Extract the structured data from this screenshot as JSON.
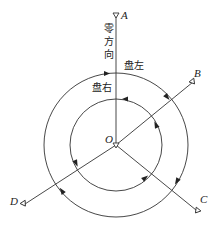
{
  "diagram": {
    "title": "",
    "center_label": "O",
    "zero_direction_label": "零方向",
    "zero_direction_chars": [
      "零",
      "方",
      "向"
    ],
    "outer_circle_label": "盘左",
    "inner_circle_label": "盘右",
    "stations": [
      {
        "id": "A",
        "label": "A"
      },
      {
        "id": "B",
        "label": "B"
      },
      {
        "id": "C",
        "label": "C"
      },
      {
        "id": "D",
        "label": "D"
      }
    ],
    "colors": {
      "line": "#333333",
      "background": "#ffffff"
    }
  }
}
